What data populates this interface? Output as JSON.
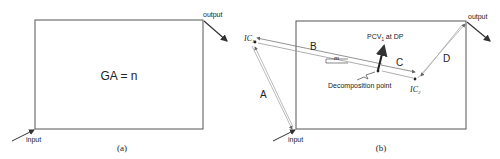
{
  "panel_a": {
    "caption": "(a)",
    "center_label": "GA = n",
    "input_label": "input",
    "output_label": "output"
  },
  "panel_b": {
    "caption": "(b)",
    "input_label": "input",
    "output_label": "output",
    "ic1_label": "IC",
    "ic1_sub": "1",
    "ic2_label": "IC",
    "ic2_sub": "2",
    "segment_a": "A",
    "segment_b": "B",
    "segment_c": "C",
    "segment_d": "D",
    "slope_label": "m",
    "pcv_label": "PCV",
    "pcv_sub": "1",
    "pcv_suffix": " at DP",
    "decomposition_label": "Decomposition point"
  },
  "colors": {
    "stroke": "#555555",
    "light_stroke": "#aaaaaa",
    "text": "#222222"
  }
}
